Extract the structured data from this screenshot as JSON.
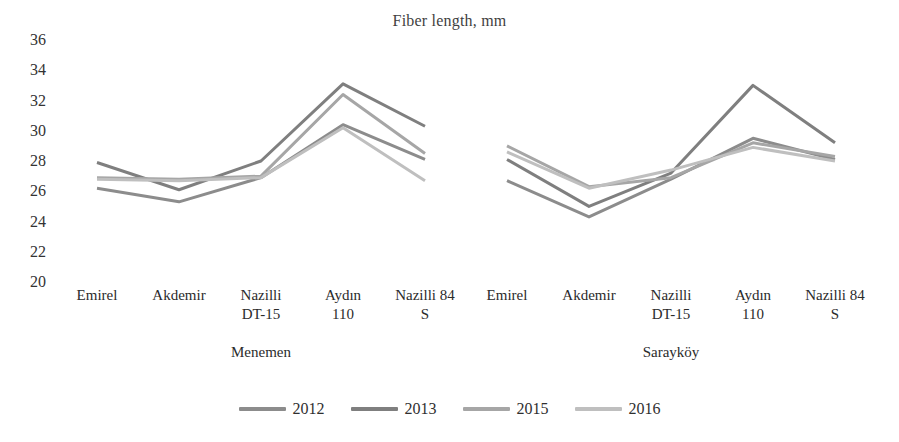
{
  "chart_data": {
    "type": "line",
    "title": "Fiber length, mm",
    "xlabel": "",
    "ylabel": "",
    "ylim": [
      20,
      36
    ],
    "yticks": [
      20,
      22,
      24,
      26,
      28,
      30,
      32,
      34,
      36
    ],
    "grid": false,
    "legend_position": "bottom",
    "groups": [
      {
        "name": "Menemen",
        "categories": [
          "Emirel",
          "Akdemir",
          "Nazilli DT-15",
          "Aydın 110",
          "Nazilli 84 S"
        ]
      },
      {
        "name": "Sarayköy",
        "categories": [
          "Emirel",
          "Akdemir",
          "Nazilli DT-15",
          "Aydın 110",
          "Nazilli 84 S"
        ]
      }
    ],
    "categories": [
      "Emirel",
      "Akdemir",
      "Nazilli DT-15",
      "Aydın 110",
      "Nazilli 84 S",
      "Emirel",
      "Akdemir",
      "Nazilli DT-15",
      "Aydın 110",
      "Nazilli 84 S"
    ],
    "series": [
      {
        "name": "2012",
        "color": "#8c8c8c",
        "values": [
          26.2,
          25.3,
          26.9,
          30.4,
          28.1,
          26.7,
          24.3,
          26.8,
          29.5,
          28.1
        ]
      },
      {
        "name": "2013",
        "color": "#7f7f7f",
        "values": [
          27.9,
          26.1,
          28.0,
          33.1,
          30.3,
          28.1,
          25.0,
          27.2,
          33.0,
          29.2
        ]
      },
      {
        "name": "2015",
        "color": "#a6a6a6",
        "values": [
          26.9,
          26.8,
          27.0,
          32.4,
          28.5,
          29.0,
          26.3,
          26.9,
          29.2,
          28.3
        ]
      },
      {
        "name": "2016",
        "color": "#bfbfbf",
        "values": [
          26.8,
          26.7,
          26.9,
          30.2,
          26.7,
          28.6,
          26.2,
          27.4,
          28.9,
          28.0
        ]
      }
    ]
  },
  "legend": {
    "items": [
      {
        "label": "2012",
        "color": "#8c8c8c"
      },
      {
        "label": "2013",
        "color": "#7f7f7f"
      },
      {
        "label": "2015",
        "color": "#a6a6a6"
      },
      {
        "label": "2016",
        "color": "#bfbfbf"
      }
    ]
  }
}
